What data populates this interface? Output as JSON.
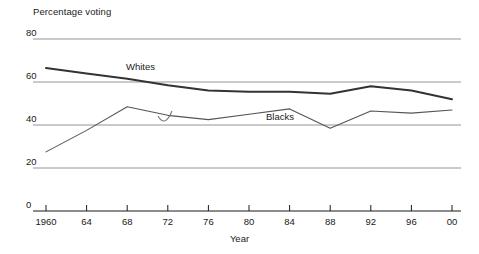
{
  "chart_data": {
    "type": "line",
    "title": "",
    "ylabel": "Percentage voting",
    "xlabel": "Year",
    "ylim": [
      0,
      80
    ],
    "yticks": [
      0,
      20,
      40,
      60,
      80
    ],
    "ytick_labels": [
      "0",
      "20",
      "40",
      "60",
      "80"
    ],
    "grid": true,
    "grid_axis": "y",
    "legend": "inline-labels",
    "x": [
      1960,
      1964,
      1968,
      1972,
      1976,
      1980,
      1984,
      1988,
      1992,
      1996,
      2000
    ],
    "xtick_labels": [
      "1960",
      "64",
      "68",
      "72",
      "76",
      "80",
      "84",
      "88",
      "92",
      "96",
      "00"
    ],
    "series": [
      {
        "name": "Whites",
        "label": "Whites",
        "color": "#333333",
        "width": 2.0,
        "values": [
          66.5,
          64.0,
          61.5,
          58.5,
          56.0,
          55.5,
          55.5,
          54.5,
          58.0,
          56.0,
          52.0
        ]
      },
      {
        "name": "Blacks",
        "label": "Blacks",
        "color": "#555555",
        "width": 1.1,
        "values": [
          27.5,
          37.5,
          48.5,
          44.5,
          42.5,
          45.0,
          47.5,
          38.5,
          46.5,
          45.5,
          47.0
        ]
      }
    ],
    "annotations": [
      {
        "name": "smudge-mark",
        "x": 165,
        "y": 121,
        "kind": "curved-artifact"
      }
    ]
  },
  "axes": {
    "baseline_color": "#1a1a1a",
    "gridline_color": "#888888",
    "tick_color": "#1a1a1a"
  },
  "labels": {
    "y_axis_title": "Percentage voting",
    "x_axis_title": "Year",
    "whites": "Whites",
    "blacks": "Blacks"
  }
}
